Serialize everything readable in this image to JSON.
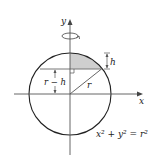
{
  "diagram": {
    "labels": {
      "x_axis": "x",
      "y_axis": "y",
      "height": "h",
      "offset": "r − h",
      "radius": "r",
      "equation_lhs": "x² + y²",
      "equation_eq": "=",
      "equation_rhs": "r²"
    },
    "geometry": {
      "center": [
        70,
        94
      ],
      "radius": 41,
      "chord_y": 69,
      "chord_x_left": 40,
      "chord_x_right": 101
    },
    "colors": {
      "stroke": "#222222",
      "axis": "#555555",
      "shade": "#cfcfcf"
    },
    "icons": [
      "rotation-arrow-icon",
      "right-angle-marker-icon",
      "arrowhead-icon"
    ]
  }
}
